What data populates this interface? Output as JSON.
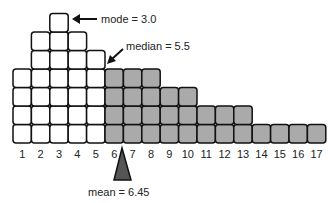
{
  "chart_data": {
    "type": "bar",
    "style": "stacked unit squares (dot histogram)",
    "categories": [
      "1",
      "2",
      "3",
      "4",
      "5",
      "6",
      "7",
      "8",
      "9",
      "10",
      "11",
      "12",
      "13",
      "14",
      "15",
      "16",
      "17"
    ],
    "values": [
      4,
      6,
      7,
      6,
      5,
      4,
      4,
      4,
      3,
      3,
      2,
      2,
      2,
      1,
      1,
      1,
      1
    ],
    "title": "",
    "xlabel": "",
    "ylabel": "",
    "fill_white_through": 5,
    "fill_grey_from": 6,
    "colors": {
      "low": "#ffffff",
      "high": "#aaaaaa",
      "outline": "#111111",
      "mean_marker": "#555555"
    },
    "annotations": [
      {
        "label": "mode = 3.0",
        "x": 3.0
      },
      {
        "label": "median = 5.5",
        "x": 5.5
      },
      {
        "label": "mean = 6.45",
        "x": 6.45
      }
    ]
  },
  "labels": {
    "mode": "mode = 3.0",
    "median": "median = 5.5",
    "mean": "mean = 6.45"
  }
}
